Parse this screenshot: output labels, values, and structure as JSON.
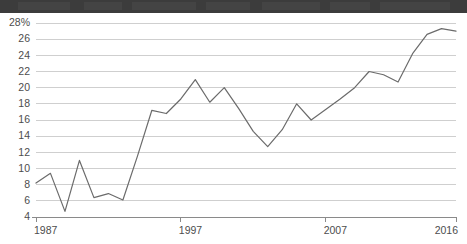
{
  "top_band": {
    "name": "cropped-title-strip",
    "color": "#3c3c3c"
  },
  "chart_data": {
    "type": "line",
    "title": "",
    "subtitle": "",
    "xlabel": "",
    "ylabel": "",
    "grid": "horizontal",
    "legend": "none",
    "xlim": [
      1987,
      2016
    ],
    "ylim": [
      4,
      28
    ],
    "x_tick_labels": [
      "1987",
      "1997",
      "2007",
      "2016"
    ],
    "x_tick_values": [
      1987,
      1997,
      2007,
      2016
    ],
    "y_tick_labels": [
      "28%",
      "26",
      "24",
      "22",
      "20",
      "18",
      "16",
      "14",
      "12",
      "10",
      "8",
      "6",
      "4"
    ],
    "y_tick_values": [
      28,
      26,
      24,
      22,
      20,
      18,
      16,
      14,
      12,
      10,
      8,
      6,
      4
    ],
    "y_unit": "%",
    "line_color": "#6b6b6b",
    "series": [
      {
        "name": "percent",
        "x": [
          1987,
          1988,
          1989,
          1990,
          1991,
          1992,
          1993,
          1994,
          1995,
          1996,
          1997,
          1998,
          1999,
          2000,
          2001,
          2002,
          2003,
          2004,
          2005,
          2006,
          2007,
          2008,
          2009,
          2010,
          2011,
          2012,
          2013,
          2014,
          2015,
          2016
        ],
        "values": [
          8.2,
          9.4,
          4.7,
          11.0,
          6.4,
          6.9,
          6.1,
          11.5,
          17.2,
          16.8,
          18.6,
          21.0,
          18.2,
          20.0,
          17.4,
          14.6,
          12.7,
          14.8,
          18.0,
          16.0,
          17.3,
          18.6,
          20.0,
          22.0,
          21.6,
          20.7,
          24.2,
          26.6,
          27.3,
          27.0
        ]
      }
    ]
  }
}
